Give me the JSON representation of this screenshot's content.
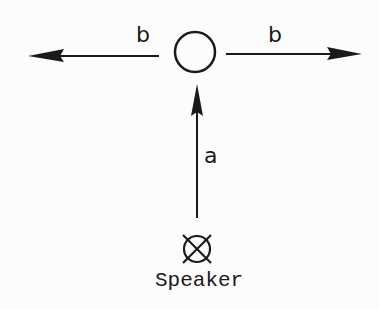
{
  "diagram": {
    "labels": {
      "left_arrow": "b",
      "right_arrow": "b",
      "vertical_arrow": "a",
      "speaker": "Speaker"
    },
    "nodes": [
      {
        "id": "listener",
        "shape": "circle"
      },
      {
        "id": "speaker",
        "shape": "circle-with-x",
        "label": "Speaker"
      }
    ],
    "edges": [
      {
        "from": "speaker",
        "to": "listener",
        "label": "a",
        "direction": "up"
      },
      {
        "from": "listener",
        "to": "left",
        "label": "b",
        "direction": "left"
      },
      {
        "from": "listener",
        "to": "right",
        "label": "b",
        "direction": "right"
      }
    ],
    "colors": {
      "stroke": "#1a1a1a",
      "background": "#fcfcfc"
    }
  }
}
